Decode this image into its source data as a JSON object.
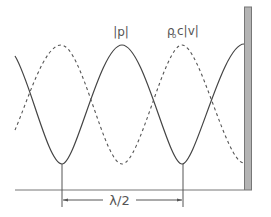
{
  "diagram": {
    "labels": {
      "pressure": "|p|",
      "velocity": "ρ₀c|v|",
      "velocity_rho": "ρ",
      "velocity_sub": "o",
      "velocity_rest": "c|v|",
      "spacing": "λ/2"
    },
    "curves": [
      {
        "name": "pressure-magnitude",
        "style": "solid",
        "label": "|p|"
      },
      {
        "name": "velocity-magnitude",
        "style": "dashed",
        "label": "ρ₀c|v|"
      }
    ],
    "colors": {
      "curve": "#444444",
      "wall_fill": "#b0b0b0",
      "wall_border": "#777777",
      "baseline": "#666666"
    }
  }
}
